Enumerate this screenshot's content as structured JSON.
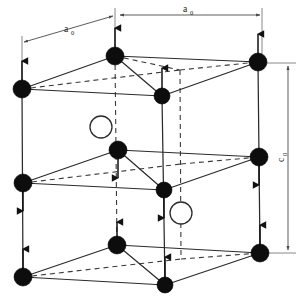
{
  "figure": {
    "name": "tetragonal-antiferromagnetic-unit-cell",
    "background_color": "#ffffff",
    "atom_fill_color": "#0d0d0d",
    "open_circle_color": "#ffffff",
    "edge_color": "#2b2b2b",
    "hidden_edge_style": "dashed"
  },
  "labels": {
    "a_top_left": {
      "base": "a",
      "sub": "0"
    },
    "a_top_right": {
      "base": "a",
      "sub": "0"
    },
    "c_right": {
      "base": "c",
      "sub": "0"
    }
  },
  "dimensions": [
    {
      "id": "a0-left",
      "label": "a0",
      "orientation": "oblique-horizontal",
      "x1": 22,
      "y1": 42,
      "x2": 115,
      "y2": 14
    },
    {
      "id": "a0-right",
      "label": "a0",
      "orientation": "horizontal",
      "x1": 118,
      "y1": 14,
      "x2": 262,
      "y2": 14
    },
    {
      "id": "c0-right",
      "label": "c0",
      "orientation": "vertical",
      "x1": 288,
      "y1": 64,
      "x2": 288,
      "y2": 252
    }
  ],
  "lattice": {
    "layers": [
      {
        "id": "top",
        "y_offset": 0,
        "description": "top face of unit cell"
      },
      {
        "id": "middle",
        "y_offset": 94,
        "description": "body-centering mid layer"
      },
      {
        "id": "bottom",
        "y_offset": 189,
        "description": "bottom face of unit cell"
      }
    ],
    "atoms": [
      {
        "id": "t-left",
        "layer": "top",
        "x": 22,
        "y": 89,
        "r": 9.0,
        "type": "filled",
        "spin": "up"
      },
      {
        "id": "t-back-left",
        "layer": "top",
        "x": 115,
        "y": 56,
        "r": 9.0,
        "type": "filled",
        "spin": "up"
      },
      {
        "id": "t-front-ctr",
        "layer": "top",
        "x": 162,
        "y": 96,
        "r": 8.0,
        "type": "filled",
        "spin": "up"
      },
      {
        "id": "t-right",
        "layer": "top",
        "x": 258,
        "y": 62,
        "r": 9.0,
        "type": "filled",
        "spin": "up"
      },
      {
        "id": "m-left",
        "layer": "middle",
        "x": 23,
        "y": 183,
        "r": 9.0,
        "type": "filled",
        "spin": "down"
      },
      {
        "id": "m-back-left",
        "layer": "middle",
        "x": 118,
        "y": 150,
        "r": 9.0,
        "type": "filled",
        "spin": "down"
      },
      {
        "id": "m-front-ctr",
        "layer": "middle",
        "x": 164,
        "y": 190,
        "r": 8.0,
        "type": "filled",
        "spin": "down"
      },
      {
        "id": "m-right",
        "layer": "middle",
        "x": 259,
        "y": 157,
        "r": 9.0,
        "type": "filled",
        "spin": "down"
      },
      {
        "id": "b-left",
        "layer": "bottom",
        "x": 23,
        "y": 277,
        "r": 9.0,
        "type": "filled",
        "spin": "up"
      },
      {
        "id": "b-back-left",
        "layer": "bottom",
        "x": 117,
        "y": 245,
        "r": 9.0,
        "type": "filled",
        "spin": "up"
      },
      {
        "id": "b-front-ctr",
        "layer": "bottom",
        "x": 165,
        "y": 285,
        "r": 8.0,
        "type": "filled",
        "spin": "up"
      },
      {
        "id": "b-right",
        "layer": "bottom",
        "x": 260,
        "y": 253,
        "r": 9.0,
        "type": "filled",
        "spin": "up"
      }
    ],
    "open_atoms": [
      {
        "id": "open-upper",
        "x": 101,
        "y": 127,
        "r": 11.0,
        "type": "open"
      },
      {
        "id": "open-lower",
        "x": 181,
        "y": 213,
        "r": 11.0,
        "type": "open"
      }
    ],
    "hidden_vertices": [
      {
        "id": "h-top",
        "x": 180,
        "y": 70
      },
      {
        "id": "h-middle",
        "x": 181,
        "y": 164
      },
      {
        "id": "h-bottom",
        "x": 181,
        "y": 259
      }
    ],
    "spin_legend": {
      "up": "moment oriented along +c",
      "down": "moment oriented along -c"
    }
  }
}
